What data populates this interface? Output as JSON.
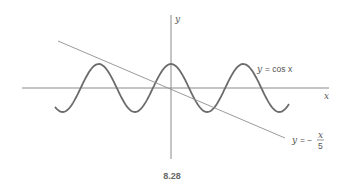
{
  "figure": {
    "caption": "8.28",
    "axes": {
      "x_label": "x",
      "y_label": "y",
      "origin_px": [
        171,
        88
      ],
      "x_axis_px": [
        22,
        329
      ],
      "y_axis_px": [
        15,
        159
      ]
    },
    "curves": [
      {
        "id": "cos",
        "label_lhs": "y",
        "label_rhs": "= cos x",
        "px_per_radian": 11.5,
        "amplitude_px": 24,
        "x_range_px": [
          55,
          289
        ],
        "label_pos": [
          257,
          72
        ]
      },
      {
        "id": "line",
        "label_lhs": "y",
        "label_eq": "= −",
        "label_num": "x",
        "label_den": "5",
        "start_px": [
          58,
          41
        ],
        "end_px": [
          285,
          138
        ],
        "label_pos": [
          292,
          142
        ]
      }
    ],
    "colors": {
      "axis": "#8a8a8a",
      "curve": "#6b6b6b",
      "line": "#8f8f8f",
      "text": "#555555"
    }
  }
}
